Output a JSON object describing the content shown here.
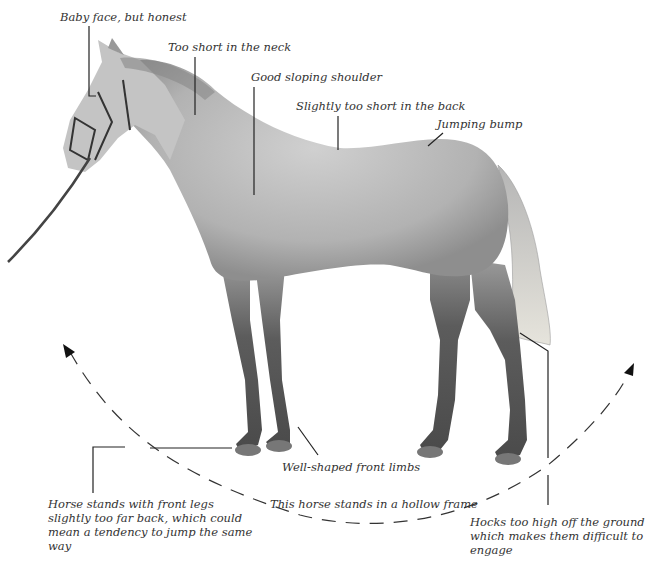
{
  "figure": {
    "annotations": {
      "baby_face": "Baby face, but honest",
      "neck": "Too short in the neck",
      "shoulder": "Good sloping shoulder",
      "back": "Slightly too short in the back",
      "jumping_bump": "Jumping bump",
      "front_limbs": "Well-shaped front limbs",
      "hollow_frame": "This horse stands in a hollow frame",
      "front_legs": "Horse stands with front legs slightly too far back, which could mean a tendency to jump the same way",
      "hocks": "Hocks too high off the ground which makes them difficult to engage"
    },
    "colors": {
      "background": "#ffffff",
      "leader_line": "#222222",
      "text": "#333333",
      "horse_body": "#b8b8b8",
      "horse_legs": "#555555",
      "tail": "#d8d8d0"
    }
  }
}
